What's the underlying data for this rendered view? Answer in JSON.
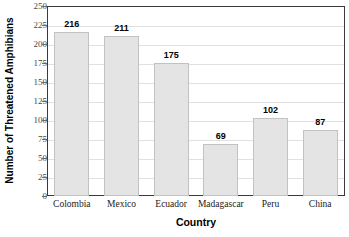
{
  "chart_data": {
    "type": "bar",
    "title": "",
    "xlabel": "Country",
    "ylabel": "Number of Threatened Amphibians",
    "categories": [
      "Colombia",
      "Mexico",
      "Ecuador",
      "Madagascar",
      "Peru",
      "China"
    ],
    "values": [
      216,
      211,
      175,
      69,
      102,
      87
    ],
    "ylim": [
      0,
      250
    ],
    "ytick_step": 25,
    "yticks": [
      250,
      225,
      200,
      175,
      150,
      125,
      100,
      75,
      50,
      25,
      0
    ],
    "grid": true,
    "legend": null,
    "bar_color": "#e4e4e4",
    "bar_border_color": "#c2c2c2",
    "axis_color": "#3a3a3a",
    "gridline_color": "#e0e0e0",
    "label_color": "#000000",
    "background": "#ffffff"
  }
}
